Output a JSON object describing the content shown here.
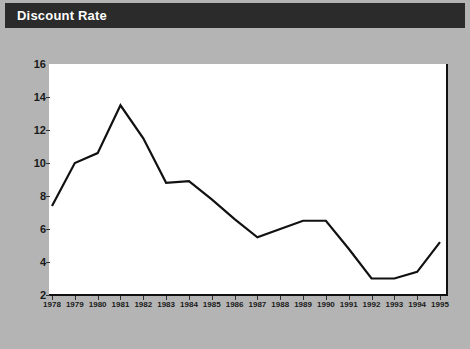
{
  "header": {
    "title": "Discount Rate",
    "bar_color": "#2b2b2b",
    "text_color": "#ffffff"
  },
  "page": {
    "background_color": "#b4b4b4",
    "plot_background_color": "#ffffff",
    "line_color": "#111111"
  },
  "chart_data": {
    "type": "line",
    "title": "Discount Rate",
    "xlabel": "",
    "ylabel": "",
    "x": [
      1978,
      1979,
      1980,
      1981,
      1982,
      1983,
      1984,
      1985,
      1986,
      1987,
      1988,
      1989,
      1990,
      1991,
      1992,
      1993,
      1994,
      1995
    ],
    "categories": [
      "1978",
      "1979",
      "1980",
      "1981",
      "1982",
      "1983",
      "1984",
      "1985",
      "1986",
      "1987",
      "1988",
      "1989",
      "1990",
      "1991",
      "1992",
      "1993",
      "1994",
      "1995"
    ],
    "values": [
      7.4,
      10.0,
      10.6,
      13.5,
      11.5,
      8.8,
      8.9,
      7.8,
      6.6,
      5.5,
      6.0,
      6.5,
      6.5,
      4.8,
      3.0,
      3.0,
      3.4,
      5.2
    ],
    "series": [
      {
        "name": "Discount Rate",
        "values": [
          7.4,
          10.0,
          10.6,
          13.5,
          11.5,
          8.8,
          8.9,
          7.8,
          6.6,
          5.5,
          6.0,
          6.5,
          6.5,
          4.8,
          3.0,
          3.0,
          3.4,
          5.2
        ]
      }
    ],
    "ylim": [
      2,
      16
    ],
    "yticks": [
      2,
      4,
      6,
      8,
      10,
      12,
      14,
      16
    ],
    "ytick_labels": [
      "2",
      "4",
      "6",
      "8",
      "10",
      "12",
      "14",
      "16"
    ],
    "xlim": [
      1978,
      1995
    ],
    "grid": false,
    "legend": false,
    "legend_position": "none"
  }
}
